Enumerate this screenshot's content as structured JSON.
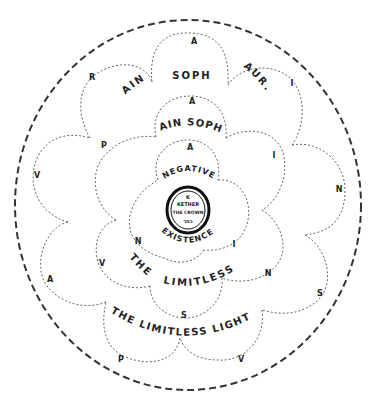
{
  "diagram": {
    "outer_circle": {
      "style": "dashed",
      "color": "#333333"
    },
    "center": {
      "letter": "K",
      "line1": "KETHER",
      "line2": "THE CROWN",
      "hebrew": "כתר"
    },
    "inner_ring": {
      "labels": [
        "NEGATIVE",
        "EXISTENCE"
      ],
      "letters": [
        "A",
        "I",
        "N"
      ]
    },
    "middle_ring": {
      "labels": [
        "AIN SOPH",
        "THE",
        "LIMITLESS"
      ],
      "letters": [
        "A",
        "I",
        "N",
        "S",
        "V",
        "P"
      ]
    },
    "outer_ring": {
      "labels": [
        "AIN",
        "SOPH",
        "AUR.",
        "THE LIMITLESS LIGHT"
      ],
      "letters": [
        "A",
        "I",
        "N",
        "S",
        "V",
        "P",
        "A",
        "V",
        "R"
      ]
    },
    "colors": {
      "ink": "#222222",
      "background": "#ffffff"
    }
  }
}
